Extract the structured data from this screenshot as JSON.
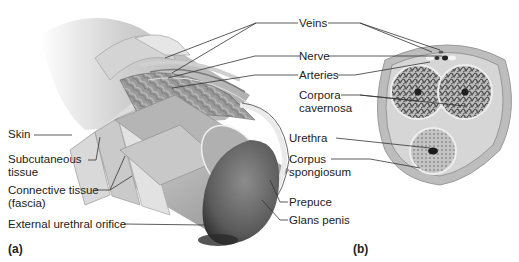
{
  "figure": {
    "panel_a": {
      "letter": "(a)",
      "description": "Longitudinal cutaway view",
      "labels": {
        "skin": "Skin",
        "subcutaneous_1": "Subcutaneous",
        "subcutaneous_2": "tissue",
        "connective_1": "Connective tissue",
        "connective_2": "(fascia)",
        "orifice": "External urethral orifice"
      }
    },
    "center_labels": {
      "veins": "Veins",
      "nerve": "Nerve",
      "arteries": "Arteries",
      "corpora_1": "Corpora",
      "corpora_2": "cavernosa",
      "urethra": "Urethra",
      "corpus_1": "Corpus",
      "corpus_2": "spongiosum",
      "prepuce": "Prepuce",
      "glans": "Glans penis"
    },
    "panel_b": {
      "letter": "(b)",
      "description": "Cross-section"
    },
    "colors": {
      "background": "#ffffff",
      "text": "#222222",
      "leader_line": "#333333",
      "tissue_light": "#d8d8d8",
      "tissue_mid": "#a8a8a8",
      "tissue_dark": "#555555"
    }
  }
}
